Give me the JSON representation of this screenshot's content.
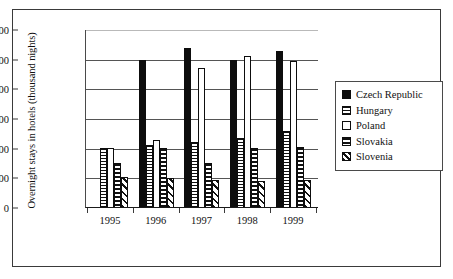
{
  "chart_data": {
    "type": "bar",
    "title": "",
    "xlabel": "",
    "ylabel": "Overnight stays in hotels (thousand nights)",
    "categories": [
      "1995",
      "1996",
      "1997",
      "1998",
      "1999"
    ],
    "ylim": [
      0,
      12000
    ],
    "yticks": [
      0,
      2000,
      4000,
      6000,
      8000,
      10000,
      12000
    ],
    "ytick_labels": [
      "0",
      "2000",
      "4000",
      "6000",
      "8000",
      "10,000",
      "12,000"
    ],
    "grid": true,
    "legend_position": "right",
    "series": [
      {
        "name": "Czech Republic",
        "pattern": "solid-black",
        "color": "#0d0d0d",
        "values": [
          null,
          9900,
          10700,
          9900,
          10550
        ]
      },
      {
        "name": "Hungary",
        "pattern": "dotted-vertical",
        "color": "#ffffff",
        "values": [
          4000,
          4150,
          4350,
          4650,
          5150
        ]
      },
      {
        "name": "Poland",
        "pattern": "empty-white",
        "color": "#ffffff",
        "values": [
          3950,
          4550,
          9400,
          10150,
          9850
        ]
      },
      {
        "name": "Slovakia",
        "pattern": "horizontal-lines",
        "color": "#ffffff",
        "values": [
          2950,
          3950,
          2950,
          3950,
          4050
        ]
      },
      {
        "name": "Slovenia",
        "pattern": "diagonal-lines",
        "color": "#ffffff",
        "values": [
          2050,
          1950,
          1800,
          1750,
          1850
        ]
      }
    ]
  },
  "legend": {
    "items": [
      {
        "label": "Czech Republic",
        "swatch": "solid-black-swatch"
      },
      {
        "label": "Hungary",
        "swatch": "dotted-vertical-swatch"
      },
      {
        "label": "Poland",
        "swatch": "empty-white-swatch"
      },
      {
        "label": "Slovakia",
        "swatch": "horizontal-lines-swatch"
      },
      {
        "label": "Slovenia",
        "swatch": "diagonal-lines-swatch"
      }
    ]
  }
}
